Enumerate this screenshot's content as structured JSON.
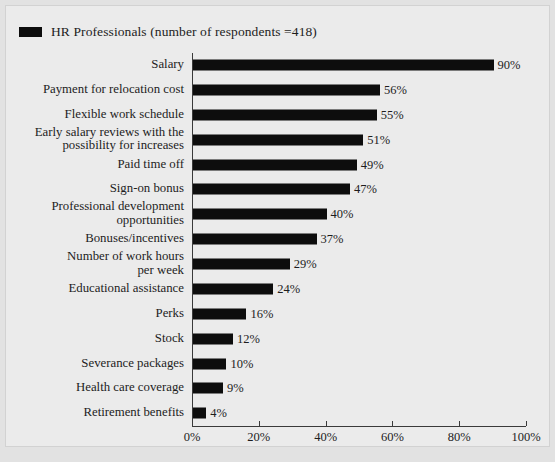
{
  "legend": {
    "label": "HR Professionals (number of respondents =418)",
    "swatch_color": "#0d0d0d",
    "swatch_name": "legend-color-swatch"
  },
  "colors": {
    "bar": "#0d0d0d",
    "plot_background": "#ebebeb",
    "page_background": "#e2e2e2",
    "axis": "#3a3a3a",
    "text": "#1d1d1d",
    "frame_border": "#d2d2d2"
  },
  "chart_data": {
    "type": "bar",
    "orientation": "horizontal",
    "title": "",
    "subtitle": "",
    "xlabel": "",
    "ylabel": "",
    "xlim": [
      0,
      100
    ],
    "grid": false,
    "legend_position": "top-left",
    "xticks": [
      0,
      20,
      40,
      60,
      80,
      100
    ],
    "xtick_labels": [
      "0%",
      "20%",
      "40%",
      "60%",
      "80%",
      "100%"
    ],
    "categories": [
      "Salary",
      "Payment for relocation cost",
      "Flexible work schedule",
      "Early salary reviews with the\npossibility for increases",
      "Paid time off",
      "Sign-on bonus",
      "Professional development\nopportunities",
      "Bonuses/incentives",
      "Number of work hours\nper week",
      "Educational assistance",
      "Perks",
      "Stock",
      "Severance packages",
      "Health care coverage",
      "Retirement benefits"
    ],
    "values": [
      90,
      56,
      55,
      51,
      49,
      47,
      40,
      37,
      29,
      24,
      16,
      12,
      10,
      9,
      4
    ],
    "value_labels": [
      "90%",
      "56%",
      "55%",
      "51%",
      "49%",
      "47%",
      "40%",
      "37%",
      "29%",
      "24%",
      "16%",
      "12%",
      "10%",
      "9%",
      "4%"
    ],
    "series": [
      {
        "name": "HR Professionals (number of respondents =418)",
        "values": [
          90,
          56,
          55,
          51,
          49,
          47,
          40,
          37,
          29,
          24,
          16,
          12,
          10,
          9,
          4
        ]
      }
    ]
  }
}
